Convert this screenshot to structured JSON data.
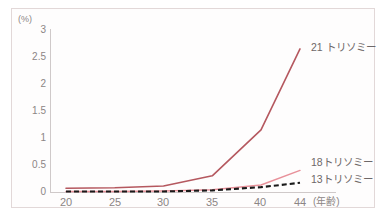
{
  "chart_data": {
    "type": "line",
    "title": "",
    "subtitle": "",
    "xlabel": "(年齢)",
    "ylabel": "(%)",
    "x": [
      20,
      25,
      30,
      35,
      40,
      44
    ],
    "xtick_labels": [
      "20",
      "25",
      "30",
      "35",
      "40",
      "44"
    ],
    "ytick_labels": [
      "3",
      "2.5",
      "2",
      "1.5",
      "1",
      "0.5",
      "0"
    ],
    "ytick_values": [
      3,
      2.5,
      2,
      1.5,
      1,
      0.5,
      0
    ],
    "xlim": [
      20,
      44
    ],
    "ylim": [
      0,
      3
    ],
    "grid": false,
    "legend_position": "inline-right-end-of-line",
    "series": [
      {
        "name": "21 トリソミー",
        "color": "#b5585f",
        "style": "solid",
        "values": [
          0.07,
          0.08,
          0.11,
          0.3,
          1.15,
          2.65
        ]
      },
      {
        "name": "18トリソミー",
        "color": "#e8919a",
        "style": "solid",
        "values": [
          0.01,
          0.01,
          0.02,
          0.04,
          0.13,
          0.4
        ]
      },
      {
        "name": "13トリソミー",
        "color": "#1a1a1a",
        "style": "dashed",
        "values": [
          0.01,
          0.01,
          0.01,
          0.03,
          0.09,
          0.17
        ]
      }
    ]
  },
  "axes": {
    "y_unit": "(%)",
    "x_unit": "(年齢)",
    "y_ticks": [
      {
        "label": "3",
        "value": 3
      },
      {
        "label": "2.5",
        "value": 2.5
      },
      {
        "label": "2",
        "value": 2
      },
      {
        "label": "1.5",
        "value": 1.5
      },
      {
        "label": "1",
        "value": 1
      },
      {
        "label": "0.5",
        "value": 0.5
      },
      {
        "label": "0",
        "value": 0
      }
    ],
    "x_ticks": [
      {
        "label": "20",
        "value": 20
      },
      {
        "label": "25",
        "value": 25
      },
      {
        "label": "30",
        "value": 30
      },
      {
        "label": "35",
        "value": 35
      },
      {
        "label": "40",
        "value": 40
      },
      {
        "label": "44",
        "value": 44
      }
    ]
  },
  "labels": {
    "trisomy21": "21 トリソミー",
    "trisomy18": "18トリソミー",
    "trisomy13": "13トリソミー"
  },
  "colors": {
    "trisomy21": "#b5585f",
    "trisomy18": "#e8919a",
    "trisomy13": "#1a1a1a",
    "axis": "#cfc9c9",
    "frame": "#e2d8d8",
    "tick_text": "#8c8585",
    "label_text": "#6e6868"
  }
}
